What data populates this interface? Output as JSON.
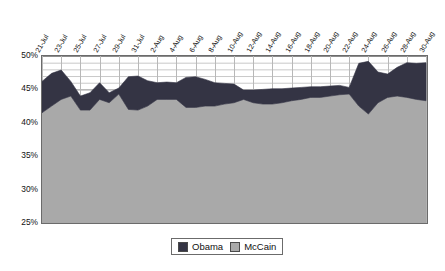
{
  "chart_data": {
    "type": "area",
    "title": "",
    "subtitle": "",
    "xlabel": "",
    "ylabel": "",
    "stacked": true,
    "ylim": [
      25,
      50
    ],
    "yticks": [
      25,
      30,
      35,
      40,
      45,
      50
    ],
    "ytick_labels": [
      "25%",
      "30%",
      "35%",
      "40%",
      "45%",
      "50%"
    ],
    "grid": "horizontal minor gridlines every 1% plus vertical gridlines at each labeled date",
    "legend_position": "bottom-center",
    "x": [
      "21-Jul",
      "22-Jul",
      "23-Jul",
      "24-Jul",
      "25-Jul",
      "26-Jul",
      "27-Jul",
      "28-Jul",
      "29-Jul",
      "30-Jul",
      "31-Jul",
      "1-Aug",
      "2-Aug",
      "3-Aug",
      "4-Aug",
      "5-Aug",
      "6-Aug",
      "7-Aug",
      "8-Aug",
      "9-Aug",
      "10-Aug",
      "11-Aug",
      "12-Aug",
      "13-Aug",
      "14-Aug",
      "15-Aug",
      "16-Aug",
      "17-Aug",
      "18-Aug",
      "19-Aug",
      "20-Aug",
      "21-Aug",
      "22-Aug",
      "23-Aug",
      "24-Aug",
      "25-Aug",
      "26-Aug",
      "27-Aug",
      "28-Aug",
      "29-Aug",
      "30-Aug"
    ],
    "xtick_labels": [
      "21-Jul",
      "23-Jul",
      "25-Jul",
      "27-Jul",
      "29-Jul",
      "31-Jul",
      "2-Aug",
      "4-Aug",
      "6-Aug",
      "8-Aug",
      "10-Aug",
      "12-Aug",
      "14-Aug",
      "16-Aug",
      "18-Aug",
      "20-Aug",
      "22-Aug",
      "24-Aug",
      "26-Aug",
      "28-Aug",
      "30-Aug"
    ],
    "series": [
      {
        "name": "McCain",
        "color": "#a9a9a9",
        "values": [
          41.5,
          42.5,
          43.5,
          44.0,
          41.9,
          41.9,
          43.5,
          43.0,
          44.3,
          42.0,
          41.9,
          42.5,
          43.5,
          43.5,
          43.5,
          42.3,
          42.3,
          42.5,
          42.5,
          42.8,
          43.0,
          43.5,
          43.0,
          42.8,
          42.8,
          43.0,
          43.3,
          43.5,
          43.8,
          43.8,
          44.0,
          44.2,
          44.3,
          42.5,
          41.3,
          43.0,
          43.8,
          44.0,
          43.8,
          43.5,
          43.3
        ]
      },
      {
        "name": "Obama",
        "color": "#343444",
        "values": [
          4.7,
          4.9,
          4.4,
          2.2,
          2.1,
          2.6,
          2.5,
          1.5,
          0.9,
          4.9,
          5.1,
          3.8,
          2.5,
          2.6,
          2.5,
          4.5,
          4.6,
          4.0,
          3.5,
          3.1,
          2.8,
          1.4,
          1.9,
          2.2,
          2.3,
          2.1,
          1.9,
          1.8,
          1.6,
          1.6,
          1.5,
          1.4,
          1.0,
          6.4,
          7.9,
          4.6,
          3.5,
          4.3,
          5.2,
          5.4,
          5.7
        ]
      }
    ],
    "totals": [
      46.2,
      47.4,
      47.9,
      46.2,
      44.0,
      44.5,
      46.0,
      44.5,
      45.2,
      46.9,
      47.0,
      46.3,
      46.0,
      46.1,
      46.0,
      46.8,
      46.9,
      46.5,
      46.0,
      45.9,
      45.8,
      44.9,
      44.9,
      45.0,
      45.1,
      45.1,
      45.2,
      45.3,
      45.4,
      45.4,
      45.5,
      45.6,
      45.3,
      48.9,
      49.2,
      47.6,
      47.3,
      48.3,
      49.0,
      48.9,
      49.0
    ],
    "legend": [
      {
        "label": "Obama",
        "color": "#343444"
      },
      {
        "label": "McCain",
        "color": "#a9a9a9"
      }
    ]
  }
}
